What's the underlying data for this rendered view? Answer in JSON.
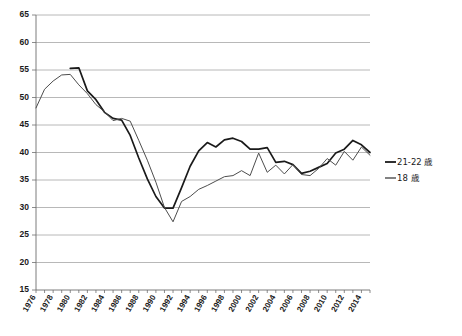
{
  "chart_data": {
    "type": "line",
    "title": "",
    "subtitle": "",
    "xlabel": "",
    "ylabel": "",
    "xlim": [
      1976,
      2015
    ],
    "ylim": [
      15,
      65
    ],
    "yticks": [
      15,
      20,
      25,
      30,
      35,
      40,
      45,
      50,
      55,
      60,
      65
    ],
    "xticks": [
      1976,
      1978,
      1980,
      1982,
      1984,
      1986,
      1988,
      1990,
      1992,
      1994,
      1996,
      1998,
      2000,
      2002,
      2004,
      2006,
      2008,
      2010,
      2012,
      2014
    ],
    "xtick_labels": [
      "1976",
      "1978",
      "1980",
      "1982",
      "1984",
      "1986",
      "1988",
      "1990",
      "1992",
      "1994",
      "1996",
      "1998",
      "2000",
      "2002",
      "2004",
      "2006",
      "2008",
      "2010",
      "2012",
      "2014"
    ],
    "grid": true,
    "grid_axis": "y",
    "legend_position": "right",
    "series": [
      {
        "name": "21-22 歳",
        "color": "#1a1a1a",
        "style": "thick",
        "x": [
          1980,
          1981,
          1982,
          1983,
          1984,
          1985,
          1986,
          1987,
          1988,
          1989,
          1990,
          1991,
          1992,
          1993,
          1994,
          1995,
          1996,
          1997,
          1998,
          1999,
          2000,
          2001,
          2002,
          2003,
          2004,
          2005,
          2006,
          2007,
          2008,
          2009,
          2010,
          2011,
          2012,
          2013,
          2014,
          2015
        ],
        "values": [
          55.3,
          55.4,
          51.2,
          49.6,
          47.3,
          46.2,
          45.9,
          43.1,
          39.0,
          35.2,
          32.0,
          29.9,
          29.9,
          33.6,
          37.5,
          40.3,
          41.8,
          41.0,
          42.3,
          42.6,
          42.0,
          40.6,
          40.6,
          40.9,
          38.2,
          38.4,
          37.8,
          36.2,
          36.6,
          37.3,
          38.0,
          39.9,
          40.6,
          42.2,
          41.4,
          40.0
        ]
      },
      {
        "name": "18 歳",
        "color": "#4d4d4d",
        "style": "thin",
        "x": [
          1976,
          1977,
          1978,
          1979,
          1980,
          1981,
          1982,
          1983,
          1984,
          1985,
          1986,
          1987,
          1988,
          1989,
          1990,
          1991,
          1992,
          1993,
          1994,
          1995,
          1996,
          1997,
          1998,
          1999,
          2000,
          2001,
          2002,
          2003,
          2004,
          2005,
          2006,
          2007,
          2008,
          2009,
          2010,
          2011,
          2012,
          2013,
          2014,
          2015
        ],
        "values": [
          48.1,
          51.5,
          53.0,
          54.1,
          54.2,
          52.3,
          50.7,
          48.7,
          47.4,
          45.8,
          46.2,
          45.7,
          42.2,
          38.6,
          34.6,
          30.0,
          27.4,
          31.1,
          32.0,
          33.3,
          34.0,
          34.8,
          35.6,
          35.8,
          36.7,
          35.8,
          39.9,
          36.4,
          37.7,
          36.1,
          37.8,
          36.0,
          35.8,
          37.1,
          38.9,
          37.7,
          40.2,
          38.6,
          41.0,
          39.5
        ]
      }
    ]
  },
  "legend": {
    "items": [
      {
        "label": "21-22 歳"
      },
      {
        "label": "18 歳"
      }
    ]
  }
}
